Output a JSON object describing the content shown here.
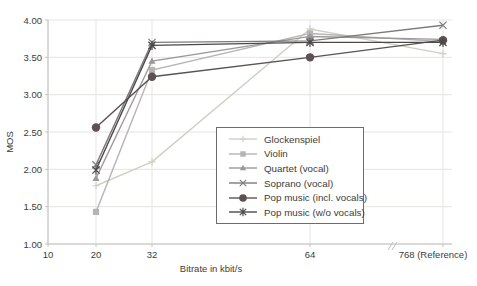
{
  "figure": {
    "background": "#ffffff",
    "text_color": "#3d3c3a",
    "grid_color": "#e4e4e1",
    "axis_color": "#c3c2bf"
  },
  "chart_data": {
    "type": "line",
    "title": "",
    "xlabel": "Bitrate in kbit/s",
    "ylabel": "MOS",
    "x_tick_labels": [
      "10",
      "20",
      "32",
      "64",
      "768 (Reference)"
    ],
    "y_tick_labels": [
      "4.00",
      "3.50",
      "3.00",
      "2.50",
      "2.00",
      "1.50",
      "1.00"
    ],
    "y_tick_values": [
      4.0,
      3.5,
      3.0,
      2.5,
      2.0,
      1.5,
      1.0
    ],
    "ylim": [
      1.0,
      4.0
    ],
    "grid": true,
    "legend_position": "inside-right",
    "axis_break_between": [
      "64",
      "768 (Reference)"
    ],
    "categories": [
      20,
      32,
      64,
      768
    ],
    "series": [
      {
        "name": "Glockenspiel",
        "marker": "plus",
        "color": "#ccd2c3",
        "values": [
          1.78,
          2.1,
          3.88,
          3.55
        ]
      },
      {
        "name": "Violin",
        "marker": "square",
        "color": "#b5b3b3",
        "values": [
          1.43,
          3.33,
          3.82,
          3.71
        ]
      },
      {
        "name": "Quartet (vocal)",
        "marker": "triangle",
        "color": "#9b9997",
        "values": [
          1.88,
          3.45,
          3.78,
          3.74
        ]
      },
      {
        "name": "Soprano (vocal)",
        "marker": "x",
        "color": "#7e7c7a",
        "values": [
          2.06,
          3.7,
          3.72,
          3.93
        ]
      },
      {
        "name": "Pop music (incl. vocals)",
        "marker": "circle",
        "color": "#5d5151",
        "values": [
          2.56,
          3.24,
          3.5,
          3.73
        ]
      },
      {
        "name": "Pop music (w/o vocals)",
        "marker": "asterisk",
        "color": "#4b4949",
        "values": [
          1.99,
          3.66,
          3.7,
          3.7
        ]
      }
    ]
  }
}
